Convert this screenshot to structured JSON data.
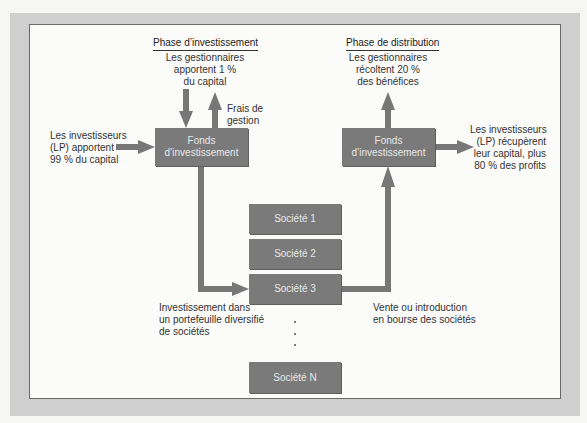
{
  "phases": {
    "investment": {
      "heading": "Phase d’investissement",
      "managers_contribution": "Les gestionnaires\napportent 1 %\ndu capital",
      "management_fees": "Frais de\ngestion",
      "investors_contribution": "Les investisseurs\n(LP) apportent\n99 % du capital",
      "fund_label": "Fonds\nd’investissement",
      "portfolio_label": "Investissement dans\nun portefeuille diversifié\nde sociétés"
    },
    "distribution": {
      "heading": "Phase de distribution",
      "managers_share": "Les gestionnaires\nrécoltent 20 %\ndes bénéfices",
      "investors_return": "Les investisseurs\n(LP) récupèrent\nleur capital, plus\n80 % des profits",
      "fund_label": "Fonds\nd’investissement",
      "exit_label": "Vente ou introduction\nen bourse des sociétés"
    }
  },
  "companies": [
    {
      "label": "Société 1"
    },
    {
      "label": "Société 2"
    },
    {
      "label": "Société 3"
    },
    {
      "label": "Société N"
    }
  ],
  "colors": {
    "box_fill": "#7a7a7a",
    "arrow": "#777777",
    "frame": "#cfcfcf",
    "panel": "#fbfbfa"
  }
}
